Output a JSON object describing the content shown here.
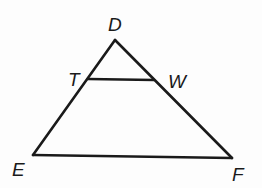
{
  "diagram": {
    "type": "triangle",
    "points": {
      "D": {
        "label": "D",
        "x": 115,
        "y": 40,
        "lx": 110,
        "ly": 32
      },
      "T": {
        "label": "T",
        "x": 88,
        "y": 79,
        "lx": 68,
        "ly": 86
      },
      "W": {
        "label": "W",
        "x": 154,
        "y": 80,
        "lx": 170,
        "ly": 88
      },
      "E": {
        "label": "E",
        "x": 33,
        "y": 155,
        "lx": 13,
        "ly": 175
      },
      "F": {
        "label": "F",
        "x": 232,
        "y": 158,
        "lx": 232,
        "ly": 180
      }
    },
    "segments": [
      {
        "from": "D",
        "to": "E"
      },
      {
        "from": "D",
        "to": "F"
      },
      {
        "from": "E",
        "to": "F"
      },
      {
        "from": "T",
        "to": "W"
      }
    ],
    "stroke_color": "#1a1a1a"
  }
}
